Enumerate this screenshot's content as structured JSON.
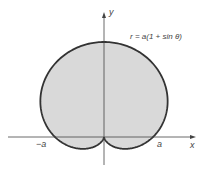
{
  "figure": {
    "equation": "r = a(1 + sin θ)",
    "x_axis_label": "x",
    "y_axis_label": "y",
    "tick_neg": "−a",
    "tick_pos": "a",
    "curve_type": "cardioid",
    "fill_color": "#d9d9d9",
    "stroke_color": "#333333"
  }
}
